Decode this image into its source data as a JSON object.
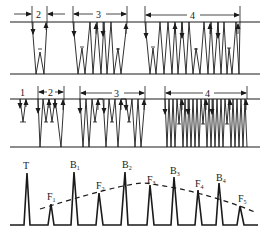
{
  "colors": {
    "ink": "#1a1a1a",
    "background": "#ffffff"
  },
  "top_panel": {
    "zones": [
      {
        "label": "2",
        "x1": 32,
        "x2": 47
      },
      {
        "label": "3",
        "x1": 73,
        "x2": 127
      },
      {
        "label": "4",
        "x1": 145,
        "x2": 240
      }
    ]
  },
  "middle_panel": {
    "zones": [
      {
        "label": "1",
        "x1": null,
        "x2": null
      },
      {
        "label": "2",
        "x1": 38,
        "x2": 64
      },
      {
        "label": "3",
        "x1": 80,
        "x2": 145
      },
      {
        "label": "4",
        "x1": 165,
        "x2": 247
      }
    ]
  },
  "bottom_panel": {
    "peaks": [
      {
        "label": "T",
        "sub": ""
      },
      {
        "label": "F",
        "sub": "1"
      },
      {
        "label": "B",
        "sub": "1"
      },
      {
        "label": "F",
        "sub": "2"
      },
      {
        "label": "B",
        "sub": "2"
      },
      {
        "label": "F",
        "sub": "3"
      },
      {
        "label": "B",
        "sub": "3"
      },
      {
        "label": "F",
        "sub": "4"
      },
      {
        "label": "B",
        "sub": "4"
      },
      {
        "label": "F",
        "sub": "5"
      }
    ]
  }
}
